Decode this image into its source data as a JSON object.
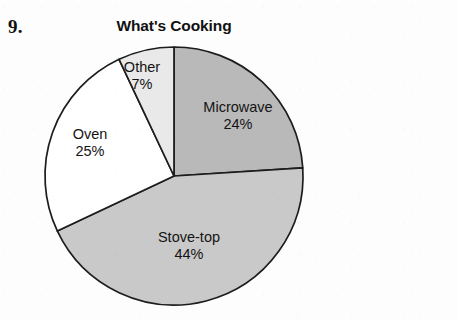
{
  "worksheet": {
    "question_number": "9."
  },
  "chart_data": {
    "type": "pie",
    "title": "What's Cooking",
    "xlabel": "",
    "ylabel": "",
    "legend_position": "none",
    "grid": false,
    "labels_on_slices": true,
    "start_angle_deg": 0,
    "direction": "clockwise",
    "categories": [
      "Microwave",
      "Stove-top",
      "Oven",
      "Other"
    ],
    "values": [
      24,
      44,
      25,
      7
    ],
    "value_suffix": "%",
    "slices": [
      {
        "name": "Microwave",
        "label": "Microwave",
        "value": 24,
        "value_text": "24%",
        "color": "#b9b9b9",
        "start_deg": 0,
        "end_deg": 86.4
      },
      {
        "name": "Stove-top",
        "label": "Stove-top",
        "value": 44,
        "value_text": "44%",
        "color": "#c9c9c9",
        "start_deg": 86.4,
        "end_deg": 244.8
      },
      {
        "name": "Oven",
        "label": "Oven",
        "value": 25,
        "value_text": "25%",
        "color": "#ffffff",
        "start_deg": 244.8,
        "end_deg": 334.8
      },
      {
        "name": "Other",
        "label": "Other",
        "value": 7,
        "value_text": "7%",
        "color": "#e9e9e9",
        "start_deg": 334.8,
        "end_deg": 360
      }
    ],
    "geometry": {
      "center_x": 174,
      "center_y": 176,
      "radius": 129
    },
    "stroke_color": "#1d1d1d"
  }
}
